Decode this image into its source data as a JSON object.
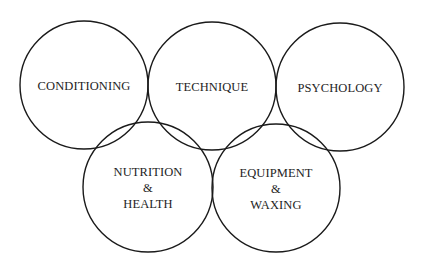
{
  "diagram": {
    "type": "overlapping-rings",
    "stroke_color": "#1a1a1a",
    "background": "#ffffff",
    "rings": [
      {
        "id": "conditioning",
        "cx": 84,
        "cy": 85,
        "r": 64,
        "lines": [
          "CONDITIONING"
        ]
      },
      {
        "id": "technique",
        "cx": 212,
        "cy": 86,
        "r": 64,
        "lines": [
          "TECHNIQUE"
        ]
      },
      {
        "id": "psychology",
        "cx": 340,
        "cy": 87,
        "r": 64,
        "lines": [
          "PSYCHOLOGY"
        ]
      },
      {
        "id": "nutrition-health",
        "cx": 148,
        "cy": 187,
        "r": 65,
        "lines": [
          "NUTRITION",
          "&",
          "HEALTH"
        ]
      },
      {
        "id": "equipment-waxing",
        "cx": 276,
        "cy": 188,
        "r": 64,
        "lines": [
          "EQUIPMENT",
          "&",
          "WAXING"
        ]
      }
    ]
  }
}
